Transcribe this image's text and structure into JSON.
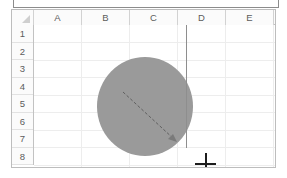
{
  "app": {
    "type": "spreadsheet",
    "formula_bar_text": "= ="
  },
  "grid": {
    "columns": [
      "A",
      "B",
      "C",
      "D",
      "E"
    ],
    "rows": [
      "1",
      "2",
      "3",
      "4",
      "5",
      "6",
      "7",
      "8"
    ],
    "select_all_corner": "select-all-triangle"
  },
  "canvas": {
    "shape": {
      "name": "oval",
      "fill_color": "#9a9a9a",
      "center_cell": "B5",
      "left": 85,
      "top": 47,
      "width": 96,
      "height": 99
    },
    "radius_guide": {
      "style": "dashed",
      "color": "#6b6b6b",
      "from_x": 111,
      "from_y": 82,
      "to_x": 164,
      "to_y": 131
    },
    "vertical_guide": {
      "color": "#8e8e8e",
      "x": 152,
      "from_y": 4,
      "to_y": 122
    },
    "cursor": {
      "name": "crosshair",
      "x": 171,
      "y": 138
    }
  },
  "colors": {
    "shape_fill": "#9a9a9a",
    "gridline": "#ededed",
    "header_bg": "#fbfbfb",
    "header_text": "#5c5c5c",
    "frame_border": "#bdbdbd",
    "guide_line": "#8e8e8e",
    "cursor": "#1d1d1d"
  }
}
